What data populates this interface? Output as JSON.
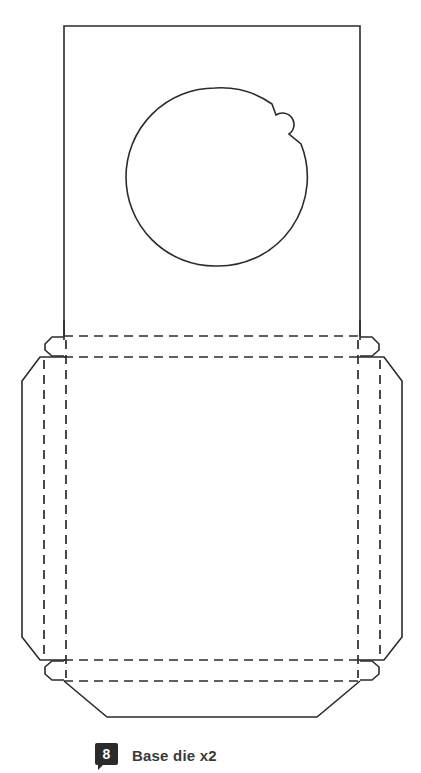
{
  "figure": {
    "caption": {
      "badge_number": "8",
      "label": "Base die x2"
    },
    "colors": {
      "stroke": "#2b2b2b",
      "background": "#ffffff",
      "badge_background": "#2b2b2b",
      "badge_text": "#ffffff",
      "caption_text": "#3a3a3a"
    },
    "parts": {
      "top_panel": "top-panel-rectangle",
      "circle_cutout": "circular-die-cut",
      "circle_tab": "circle-notch-tab",
      "base_panel": "base-panel",
      "left_side_flap": "left-side-flap",
      "right_side_flap": "right-side-flap",
      "bottom_flap": "bottom-trapezoid-flap",
      "top_left_tab": "top-left-locking-tab",
      "top_right_tab": "top-right-locking-tab",
      "bottom_left_tab": "bottom-left-locking-tab",
      "bottom_right_tab": "bottom-right-locking-tab",
      "fold_lines_horizontal": "horizontal-fold-lines",
      "fold_lines_vertical": "vertical-fold-lines"
    }
  }
}
